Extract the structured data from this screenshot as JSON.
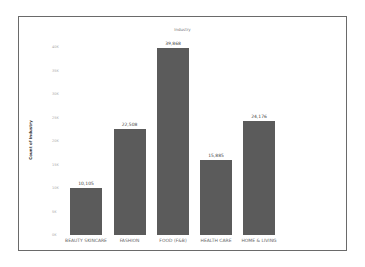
{
  "chart_data": {
    "type": "bar",
    "title": "Industry",
    "xlabel": "",
    "ylabel": "Count of Industry",
    "categories": [
      "BEAUTY SKINCARE",
      "FASHION",
      "FOOD (F&B)",
      "HEALTH CARE",
      "HOME & LIVING"
    ],
    "values": [
      10105,
      22508,
      39868,
      15885,
      24176
    ],
    "value_labels": [
      "10,105",
      "22,508",
      "39,868",
      "15,885",
      "24,176"
    ],
    "yticks": [
      "0K",
      "5K",
      "10K",
      "15K",
      "20K",
      "25K",
      "30K",
      "35K",
      "40K"
    ],
    "ylim": [
      0,
      40000
    ],
    "grid": false,
    "legend": "none",
    "bar_color": "#5b5b5b"
  }
}
